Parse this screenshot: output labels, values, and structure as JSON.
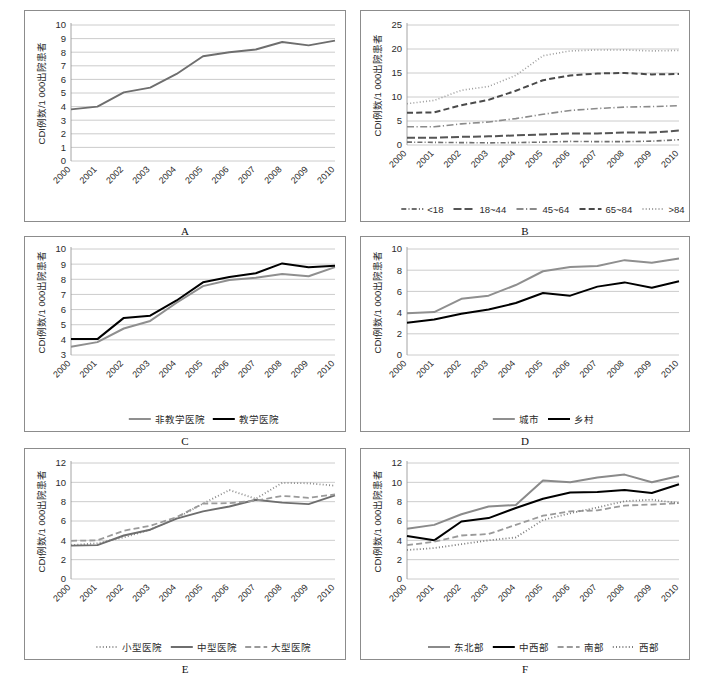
{
  "figure": {
    "years": [
      "2000",
      "2001",
      "2002",
      "2003",
      "2004",
      "2005",
      "2006",
      "2007",
      "2008",
      "2009",
      "2010"
    ],
    "y_axis_title": "CDI例数/1 000出院患者"
  },
  "panels": [
    {
      "letter": "A",
      "ylabel": "CDI例数/1 000出院患者",
      "yticks": [
        "0",
        "1",
        "2",
        "3",
        "4",
        "5",
        "6",
        "7",
        "8",
        "9",
        "10"
      ],
      "chart_data": {
        "type": "line",
        "title": "A",
        "xlabel": "",
        "ylabel": "CDI例数/1 000出院患者",
        "ylim": [
          0,
          10
        ],
        "grid": true,
        "legend_position": "none",
        "categories": [
          "2000",
          "2001",
          "2002",
          "2003",
          "2004",
          "2005",
          "2006",
          "2007",
          "2008",
          "2009",
          "2010"
        ],
        "series": [
          {
            "name": "全部",
            "color": "#6e6e6e",
            "style": "solid",
            "width": 1.9,
            "values": [
              3.8,
              4.0,
              5.05,
              5.4,
              6.4,
              7.7,
              8.0,
              8.2,
              8.75,
              8.5,
              8.85
            ]
          }
        ]
      },
      "legend": []
    },
    {
      "letter": "B",
      "ylabel": "CDI例数/1 000出院患者",
      "yticks": [
        "0",
        "5",
        "10",
        "15",
        "20",
        "25"
      ],
      "chart_data": {
        "type": "line",
        "title": "B",
        "xlabel": "",
        "ylabel": "CDI例数/1 000出院患者",
        "ylim": [
          0,
          25
        ],
        "grid": true,
        "legend_position": "bottom",
        "categories": [
          "2000",
          "2001",
          "2002",
          "2003",
          "2004",
          "2005",
          "2006",
          "2007",
          "2008",
          "2009",
          "2010"
        ],
        "series": [
          {
            "name": "<18",
            "color": "#6e6e6e",
            "style": "dash-dot-short",
            "width": 1.6,
            "values": [
              0.6,
              0.55,
              0.5,
              0.45,
              0.5,
              0.6,
              0.75,
              0.7,
              0.7,
              0.8,
              1.1
            ]
          },
          {
            "name": "18~44",
            "color": "#555555",
            "style": "dash-long",
            "width": 2.0,
            "values": [
              1.5,
              1.5,
              1.7,
              1.8,
              2.0,
              2.2,
              2.4,
              2.4,
              2.6,
              2.6,
              3.0
            ]
          },
          {
            "name": "45~64",
            "color": "#8a8a8a",
            "style": "dash-dot",
            "width": 1.6,
            "values": [
              3.8,
              3.8,
              4.4,
              4.8,
              5.5,
              6.4,
              7.2,
              7.6,
              7.9,
              8.0,
              8.2
            ]
          },
          {
            "name": "65~84",
            "color": "#4a4a4a",
            "style": "dash-medium",
            "width": 2.0,
            "values": [
              6.7,
              6.8,
              8.3,
              9.4,
              11.3,
              13.5,
              14.5,
              14.9,
              15.0,
              14.7,
              14.8
            ]
          },
          {
            "name": ">84",
            "color": "#9c9c9c",
            "style": "dotted",
            "width": 1.6,
            "values": [
              8.6,
              9.3,
              11.4,
              12.2,
              14.5,
              18.6,
              19.6,
              19.8,
              19.8,
              19.6,
              19.7
            ]
          }
        ]
      },
      "legend": [
        {
          "label": "<18",
          "color": "#6e6e6e",
          "style": "dash-dot-short"
        },
        {
          "label": "18~44",
          "color": "#555555",
          "style": "dash-long"
        },
        {
          "label": "45~64",
          "color": "#8a8a8a",
          "style": "dash-dot"
        },
        {
          "label": "65~84",
          "color": "#4a4a4a",
          "style": "dash-medium"
        },
        {
          "label": ">84",
          "color": "#9c9c9c",
          "style": "dotted"
        }
      ]
    },
    {
      "letter": "C",
      "ylabel": "CDI例数/1 000出院患者",
      "yticks": [
        "3",
        "4",
        "5",
        "6",
        "7",
        "8",
        "9",
        "10"
      ],
      "chart_data": {
        "type": "line",
        "title": "C",
        "xlabel": "",
        "ylabel": "CDI例数/1 000出院患者",
        "ylim": [
          3,
          10
        ],
        "grid": true,
        "legend_position": "bottom",
        "categories": [
          "2000",
          "2001",
          "2002",
          "2003",
          "2004",
          "2005",
          "2006",
          "2007",
          "2008",
          "2009",
          "2010"
        ],
        "series": [
          {
            "name": "非教学医院",
            "color": "#8f8f8f",
            "style": "solid",
            "width": 2.0,
            "values": [
              3.55,
              3.85,
              4.75,
              5.25,
              6.45,
              7.55,
              7.95,
              8.1,
              8.35,
              8.2,
              8.8
            ]
          },
          {
            "name": "教学医院",
            "color": "#000000",
            "style": "solid",
            "width": 2.0,
            "values": [
              4.05,
              4.05,
              5.45,
              5.6,
              6.6,
              7.8,
              8.15,
              8.4,
              9.05,
              8.8,
              8.9
            ]
          }
        ]
      },
      "legend": [
        {
          "label": "非教学医院",
          "color": "#8f8f8f",
          "style": "solid"
        },
        {
          "label": "教学医院",
          "color": "#000000",
          "style": "solid"
        }
      ]
    },
    {
      "letter": "D",
      "ylabel": "CDI例数/1 000出院患者",
      "yticks": [
        "0",
        "2",
        "4",
        "6",
        "8",
        "10"
      ],
      "chart_data": {
        "type": "line",
        "title": "D",
        "xlabel": "",
        "ylabel": "CDI例数/1 000出院患者",
        "ylim": [
          0,
          10
        ],
        "grid": true,
        "legend_position": "bottom",
        "categories": [
          "2000",
          "2001",
          "2002",
          "2003",
          "2004",
          "2005",
          "2006",
          "2007",
          "2008",
          "2009",
          "2010"
        ],
        "series": [
          {
            "name": "城市",
            "color": "#8f8f8f",
            "style": "solid",
            "width": 2.0,
            "values": [
              3.95,
              4.05,
              5.3,
              5.6,
              6.6,
              7.9,
              8.3,
              8.4,
              8.95,
              8.7,
              9.1
            ]
          },
          {
            "name": "乡村",
            "color": "#000000",
            "style": "solid",
            "width": 2.0,
            "values": [
              3.05,
              3.35,
              3.9,
              4.3,
              4.9,
              5.85,
              5.6,
              6.45,
              6.85,
              6.35,
              6.95
            ]
          }
        ]
      },
      "legend": [
        {
          "label": "城市",
          "color": "#8f8f8f",
          "style": "solid"
        },
        {
          "label": "乡村",
          "color": "#000000",
          "style": "solid"
        }
      ]
    },
    {
      "letter": "E",
      "ylabel": "CDI例数/1 000出院患者",
      "yticks": [
        "0",
        "2",
        "4",
        "6",
        "8",
        "10",
        "12"
      ],
      "chart_data": {
        "type": "line",
        "title": "E",
        "xlabel": "",
        "ylabel": "CDI例数/1 000出院患者",
        "ylim": [
          0,
          12
        ],
        "grid": true,
        "legend_position": "bottom",
        "categories": [
          "2000",
          "2001",
          "2002",
          "2003",
          "2004",
          "2005",
          "2006",
          "2007",
          "2008",
          "2009",
          "2010"
        ],
        "series": [
          {
            "name": "小型医院",
            "color": "#8a8a8a",
            "style": "dotted",
            "width": 1.8,
            "values": [
              3.5,
              3.7,
              4.3,
              5.1,
              6.3,
              7.8,
              9.2,
              8.3,
              9.95,
              9.9,
              9.65
            ]
          },
          {
            "name": "中型医院",
            "color": "#6e6e6e",
            "style": "solid",
            "width": 1.9,
            "values": [
              3.45,
              3.5,
              4.5,
              5.1,
              6.25,
              7.0,
              7.5,
              8.2,
              7.9,
              7.75,
              8.65
            ]
          },
          {
            "name": "大型医院",
            "color": "#9a9a9a",
            "style": "dash-medium",
            "width": 1.8,
            "values": [
              3.95,
              4.0,
              5.0,
              5.5,
              6.4,
              7.8,
              7.85,
              8.1,
              8.6,
              8.4,
              8.75
            ]
          }
        ]
      },
      "legend": [
        {
          "label": "小型医院",
          "color": "#8a8a8a",
          "style": "dotted"
        },
        {
          "label": "中型医院",
          "color": "#6e6e6e",
          "style": "solid"
        },
        {
          "label": "大型医院",
          "color": "#9a9a9a",
          "style": "dash-medium"
        }
      ]
    },
    {
      "letter": "F",
      "ylabel": "CDI例数/1 000出院患者",
      "yticks": [
        "0",
        "2",
        "4",
        "6",
        "8",
        "10",
        "12"
      ],
      "chart_data": {
        "type": "line",
        "title": "F",
        "xlabel": "",
        "ylabel": "CDI例数/1 000出院患者",
        "ylim": [
          0,
          12
        ],
        "grid": true,
        "legend_position": "bottom",
        "categories": [
          "2000",
          "2001",
          "2002",
          "2003",
          "2004",
          "2005",
          "2006",
          "2007",
          "2008",
          "2009",
          "2010"
        ],
        "series": [
          {
            "name": "东北部",
            "color": "#8a8a8a",
            "style": "solid",
            "width": 2.0,
            "values": [
              5.2,
              5.6,
              6.7,
              7.5,
              7.65,
              10.2,
              10.0,
              10.5,
              10.8,
              10.0,
              10.65
            ]
          },
          {
            "name": "中西部",
            "color": "#000000",
            "style": "solid",
            "width": 2.0,
            "values": [
              4.45,
              4.0,
              5.95,
              6.3,
              7.35,
              8.3,
              8.95,
              9.0,
              9.2,
              8.9,
              9.8
            ]
          },
          {
            "name": "南部",
            "color": "#9a9a9a",
            "style": "dash-medium",
            "width": 1.8,
            "values": [
              3.5,
              3.85,
              4.5,
              4.65,
              5.6,
              6.55,
              7.0,
              7.1,
              7.6,
              7.7,
              7.85
            ]
          },
          {
            "name": "西部",
            "color": "#7d7d7d",
            "style": "dotted",
            "width": 1.8,
            "values": [
              3.0,
              3.2,
              3.6,
              4.0,
              4.3,
              6.1,
              6.8,
              7.4,
              8.05,
              8.2,
              7.85
            ]
          }
        ]
      },
      "legend": [
        {
          "label": "东北部",
          "color": "#8a8a8a",
          "style": "solid"
        },
        {
          "label": "中西部",
          "color": "#000000",
          "style": "solid"
        },
        {
          "label": "南部",
          "color": "#9a9a9a",
          "style": "dash-medium"
        },
        {
          "label": "西部",
          "color": "#7d7d7d",
          "style": "dotted"
        }
      ]
    }
  ],
  "chart_data": [
    {
      "type": "line",
      "title": "A 总体CDI发病率",
      "ylabel": "CDI例数/1 000出院患者",
      "ylim": [
        0,
        10
      ],
      "categories": [
        "2000",
        "2001",
        "2002",
        "2003",
        "2004",
        "2005",
        "2006",
        "2007",
        "2008",
        "2009",
        "2010"
      ],
      "series": [
        {
          "name": "全部",
          "values": [
            3.8,
            4.0,
            5.05,
            5.4,
            6.4,
            7.7,
            8.0,
            8.2,
            8.75,
            8.5,
            8.85
          ]
        }
      ]
    },
    {
      "type": "line",
      "title": "B 按年龄组",
      "ylabel": "CDI例数/1 000出院患者",
      "ylim": [
        0,
        25
      ],
      "categories": [
        "2000",
        "2001",
        "2002",
        "2003",
        "2004",
        "2005",
        "2006",
        "2007",
        "2008",
        "2009",
        "2010"
      ],
      "series": [
        {
          "name": "<18",
          "values": [
            0.6,
            0.55,
            0.5,
            0.45,
            0.5,
            0.6,
            0.75,
            0.7,
            0.7,
            0.8,
            1.1
          ]
        },
        {
          "name": "18~44",
          "values": [
            1.5,
            1.5,
            1.7,
            1.8,
            2.0,
            2.2,
            2.4,
            2.4,
            2.6,
            2.6,
            3.0
          ]
        },
        {
          "name": "45~64",
          "values": [
            3.8,
            3.8,
            4.4,
            4.8,
            5.5,
            6.4,
            7.2,
            7.6,
            7.9,
            8.0,
            8.2
          ]
        },
        {
          "name": "65~84",
          "values": [
            6.7,
            6.8,
            8.3,
            9.4,
            11.3,
            13.5,
            14.5,
            14.9,
            15.0,
            14.7,
            14.8
          ]
        },
        {
          "name": ">84",
          "values": [
            8.6,
            9.3,
            11.4,
            12.2,
            14.5,
            18.6,
            19.6,
            19.8,
            19.8,
            19.6,
            19.7
          ]
        }
      ]
    },
    {
      "type": "line",
      "title": "C 按教学状态",
      "ylabel": "CDI例数/1 000出院患者",
      "ylim": [
        3,
        10
      ],
      "categories": [
        "2000",
        "2001",
        "2002",
        "2003",
        "2004",
        "2005",
        "2006",
        "2007",
        "2008",
        "2009",
        "2010"
      ],
      "series": [
        {
          "name": "非教学医院",
          "values": [
            3.55,
            3.85,
            4.75,
            5.25,
            6.45,
            7.55,
            7.95,
            8.1,
            8.35,
            8.2,
            8.8
          ]
        },
        {
          "name": "教学医院",
          "values": [
            4.05,
            4.05,
            5.45,
            5.6,
            6.6,
            7.8,
            8.15,
            8.4,
            9.05,
            8.8,
            8.9
          ]
        }
      ]
    },
    {
      "type": "line",
      "title": "D 按城乡",
      "ylabel": "CDI例数/1 000出院患者",
      "ylim": [
        0,
        10
      ],
      "categories": [
        "2000",
        "2001",
        "2002",
        "2003",
        "2004",
        "2005",
        "2006",
        "2007",
        "2008",
        "2009",
        "2010"
      ],
      "series": [
        {
          "name": "城市",
          "values": [
            3.95,
            4.05,
            5.3,
            5.6,
            6.6,
            7.9,
            8.3,
            8.4,
            8.95,
            8.7,
            9.1
          ]
        },
        {
          "name": "乡村",
          "values": [
            3.05,
            3.35,
            3.9,
            4.3,
            4.9,
            5.85,
            5.6,
            6.45,
            6.85,
            6.35,
            6.95
          ]
        }
      ]
    },
    {
      "type": "line",
      "title": "E 按医院规模",
      "ylabel": "CDI例数/1 000出院患者",
      "ylim": [
        0,
        12
      ],
      "categories": [
        "2000",
        "2001",
        "2002",
        "2003",
        "2004",
        "2005",
        "2006",
        "2007",
        "2008",
        "2009",
        "2010"
      ],
      "series": [
        {
          "name": "小型医院",
          "values": [
            3.5,
            3.7,
            4.3,
            5.1,
            6.3,
            7.8,
            9.2,
            8.3,
            9.95,
            9.9,
            9.65
          ]
        },
        {
          "name": "中型医院",
          "values": [
            3.45,
            3.5,
            4.5,
            5.1,
            6.25,
            7.0,
            7.5,
            8.2,
            7.9,
            7.75,
            8.65
          ]
        },
        {
          "name": "大型医院",
          "values": [
            3.95,
            4.0,
            5.0,
            5.5,
            6.4,
            7.8,
            7.85,
            8.1,
            8.6,
            8.4,
            8.75
          ]
        }
      ]
    },
    {
      "type": "line",
      "title": "F 按地区",
      "ylabel": "CDI例数/1 000出院患者",
      "ylim": [
        0,
        12
      ],
      "categories": [
        "2000",
        "2001",
        "2002",
        "2003",
        "2004",
        "2005",
        "2006",
        "2007",
        "2008",
        "2009",
        "2010"
      ],
      "series": [
        {
          "name": "东北部",
          "values": [
            5.2,
            5.6,
            6.7,
            7.5,
            7.65,
            10.2,
            10.0,
            10.5,
            10.8,
            10.0,
            10.65
          ]
        },
        {
          "name": "中西部",
          "values": [
            4.45,
            4.0,
            5.95,
            6.3,
            7.35,
            8.3,
            8.95,
            9.0,
            9.2,
            8.9,
            9.8
          ]
        },
        {
          "name": "南部",
          "values": [
            3.5,
            3.85,
            4.5,
            4.65,
            5.6,
            6.55,
            7.0,
            7.1,
            7.6,
            7.7,
            7.85
          ]
        },
        {
          "name": "西部",
          "values": [
            3.0,
            3.2,
            3.6,
            4.0,
            4.3,
            6.1,
            6.8,
            7.4,
            8.05,
            8.2,
            7.85
          ]
        }
      ]
    }
  ]
}
